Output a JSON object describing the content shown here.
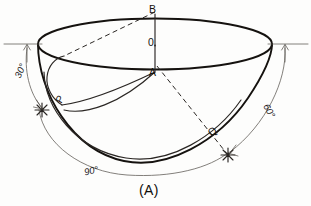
{
  "figure": {
    "caption": "(A)",
    "points": [
      {
        "id": "B",
        "label": "B",
        "x": 155,
        "y": 12
      },
      {
        "id": "O",
        "label": "0",
        "x": 155,
        "y": 42
      },
      {
        "id": "A",
        "label": "A",
        "x": 155,
        "y": 72
      },
      {
        "id": "P",
        "label": "P",
        "x": 60,
        "y": 99
      },
      {
        "id": "Q",
        "label": "Q",
        "x": 213,
        "y": 131
      }
    ],
    "angles": [
      {
        "id": "left",
        "label": "30°",
        "value": 30
      },
      {
        "id": "right",
        "label": "60°",
        "value": 60
      },
      {
        "id": "bottom",
        "label": "90°",
        "value": 90
      }
    ],
    "colors": {
      "background": "#fdfdfc",
      "heavy_stroke": "#15120f",
      "medium_stroke": "#2a2623",
      "thin_stroke": "#5a5550",
      "text": "#17140f"
    },
    "markers": [
      {
        "id": "star-left",
        "x": 42,
        "y": 110
      },
      {
        "id": "star-right",
        "x": 228,
        "y": 155
      }
    ]
  }
}
